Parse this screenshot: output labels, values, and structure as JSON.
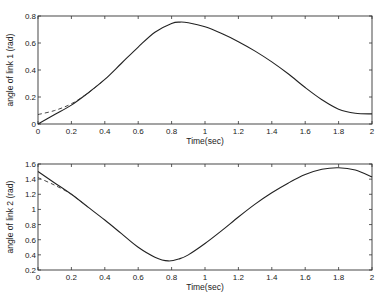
{
  "chart_data": [
    {
      "type": "line",
      "title": "",
      "xlabel": "Time(sec)",
      "ylabel": "angle of link 1 (rad)",
      "xlim": [
        0,
        2
      ],
      "ylim": [
        0,
        0.8
      ],
      "xticks": [
        "0",
        "0.2",
        "0.4",
        "0.6",
        "0.8",
        "1",
        "1.2",
        "1.4",
        "1.6",
        "1.8",
        "2"
      ],
      "yticks": [
        "0",
        "0.2",
        "0.4",
        "0.6",
        "0.8"
      ],
      "grid": false,
      "legend": null,
      "series": [
        {
          "name": "actual",
          "style": "solid",
          "x": [
            0,
            0.1,
            0.2,
            0.3,
            0.4,
            0.5,
            0.6,
            0.7,
            0.8,
            0.85,
            0.9,
            1.0,
            1.1,
            1.2,
            1.3,
            1.4,
            1.5,
            1.6,
            1.7,
            1.8,
            1.9,
            2.0
          ],
          "values": [
            0.0,
            0.07,
            0.14,
            0.23,
            0.33,
            0.45,
            0.57,
            0.68,
            0.745,
            0.755,
            0.75,
            0.72,
            0.67,
            0.61,
            0.54,
            0.46,
            0.37,
            0.27,
            0.18,
            0.11,
            0.08,
            0.075
          ]
        },
        {
          "name": "desired",
          "style": "dashed",
          "x": [
            0,
            0.1,
            0.2,
            0.3,
            0.4
          ],
          "values": [
            0.07,
            0.1,
            0.15,
            0.23,
            0.33
          ]
        }
      ]
    },
    {
      "type": "line",
      "title": "",
      "xlabel": "Time(sec)",
      "ylabel": "angle of link 2 (rad)",
      "xlim": [
        0,
        2
      ],
      "ylim": [
        0.2,
        1.6
      ],
      "xticks": [
        "0",
        "0.2",
        "0.4",
        "0.6",
        "0.8",
        "1",
        "1.2",
        "1.4",
        "1.6",
        "1.8",
        "2"
      ],
      "yticks": [
        "0.2",
        "0.4",
        "0.6",
        "0.8",
        "1",
        "1.2",
        "1.4",
        "1.6"
      ],
      "grid": false,
      "legend": null,
      "series": [
        {
          "name": "actual",
          "style": "solid",
          "x": [
            0,
            0.1,
            0.2,
            0.3,
            0.4,
            0.5,
            0.6,
            0.7,
            0.78,
            0.85,
            0.9,
            1.0,
            1.1,
            1.2,
            1.3,
            1.4,
            1.5,
            1.6,
            1.7,
            1.8,
            1.9,
            2.0
          ],
          "values": [
            1.5,
            1.35,
            1.2,
            1.03,
            0.86,
            0.68,
            0.5,
            0.37,
            0.32,
            0.35,
            0.4,
            0.55,
            0.72,
            0.9,
            1.07,
            1.22,
            1.35,
            1.46,
            1.53,
            1.55,
            1.52,
            1.43
          ]
        },
        {
          "name": "desired",
          "style": "dashed",
          "x": [
            0,
            0.1,
            0.2,
            0.3
          ],
          "values": [
            1.42,
            1.32,
            1.2,
            1.03
          ]
        }
      ]
    }
  ]
}
